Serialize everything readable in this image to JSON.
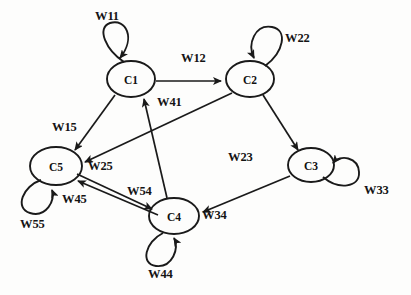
{
  "diagram": {
    "background_color": "#fdfdfc",
    "stroke_color": "#1a1a1a",
    "nodes": [
      {
        "id": "C1",
        "label": "C1",
        "cx": 131,
        "cy": 79,
        "rx": 24,
        "ry": 18
      },
      {
        "id": "C2",
        "label": "C2",
        "cx": 250,
        "cy": 79,
        "rx": 24,
        "ry": 18
      },
      {
        "id": "C3",
        "label": "C3",
        "cx": 311,
        "cy": 165,
        "rx": 23,
        "ry": 17
      },
      {
        "id": "C4",
        "label": "C4",
        "cx": 174,
        "cy": 216,
        "rx": 25,
        "ry": 18
      },
      {
        "id": "C5",
        "label": "C5",
        "cx": 56,
        "cy": 166,
        "rx": 26,
        "ry": 19
      }
    ],
    "edges": [
      {
        "id": "W11",
        "label": "W11",
        "from": "C1",
        "to": "C1",
        "kind": "self",
        "label_x": 95,
        "label_y": 9
      },
      {
        "id": "W22",
        "label": "W22",
        "from": "C2",
        "to": "C2",
        "kind": "self",
        "label_x": 285,
        "label_y": 31
      },
      {
        "id": "W33",
        "label": "W33",
        "from": "C3",
        "to": "C3",
        "kind": "self",
        "label_x": 364,
        "label_y": 183
      },
      {
        "id": "W44",
        "label": "W44",
        "from": "C4",
        "to": "C4",
        "kind": "self",
        "label_x": 148,
        "label_y": 267
      },
      {
        "id": "W55",
        "label": "W55",
        "from": "C5",
        "to": "C5",
        "kind": "self",
        "label_x": 20,
        "label_y": 217
      },
      {
        "id": "W12",
        "label": "W12",
        "from": "C1",
        "to": "C2",
        "kind": "arrow",
        "label_x": 181,
        "label_y": 51
      },
      {
        "id": "W15",
        "label": "W15",
        "from": "C1",
        "to": "C5",
        "kind": "arrow",
        "label_x": 52,
        "label_y": 120
      },
      {
        "id": "W23",
        "label": "W23",
        "from": "C2",
        "to": "C3",
        "kind": "arrow",
        "label_x": 228,
        "label_y": 150
      },
      {
        "id": "W25",
        "label": "W25",
        "from": "C2",
        "to": "C5",
        "kind": "arrow",
        "label_x": 88,
        "label_y": 159
      },
      {
        "id": "W34",
        "label": "W34",
        "from": "C3",
        "to": "C4",
        "kind": "arrow",
        "label_x": 202,
        "label_y": 208
      },
      {
        "id": "W41",
        "label": "W41",
        "from": "C4",
        "to": "C1",
        "kind": "arrow",
        "label_x": 157,
        "label_y": 95
      },
      {
        "id": "W45",
        "label": "W45",
        "from": "C4",
        "to": "C5",
        "kind": "arrow",
        "label_x": 62,
        "label_y": 192
      },
      {
        "id": "W54",
        "label": "W54",
        "from": "C5",
        "to": "C4",
        "kind": "arrow",
        "label_x": 127,
        "label_y": 184
      }
    ]
  }
}
